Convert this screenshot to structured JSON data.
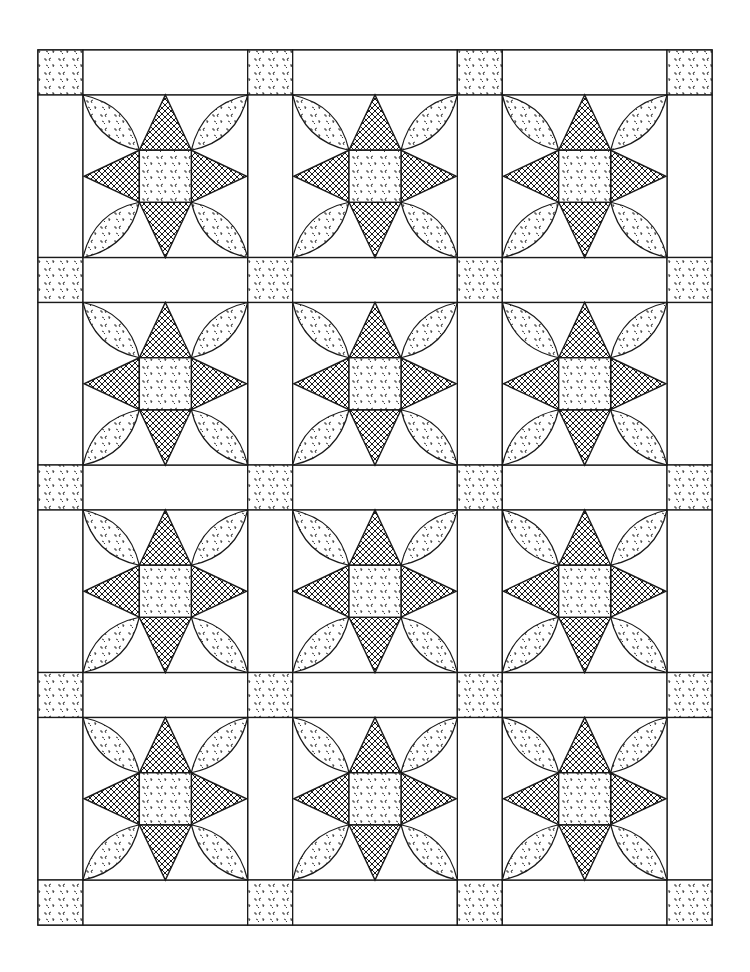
{
  "figure": {
    "pattern": "Eight-point star with curved petal leaves, sashed blocks with cornerstones",
    "grid": {
      "columns": 3,
      "rows": 4
    },
    "colors": {
      "background": "#ffffff",
      "line": "#1a1a1a",
      "crosshatch": "#1a1a1a",
      "speckle": "#222222"
    },
    "fills": {
      "star_points": "crosshatch",
      "center_square": "speckled",
      "petals": "speckled",
      "cornerstones": "speckled",
      "sashing": "plain"
    }
  }
}
